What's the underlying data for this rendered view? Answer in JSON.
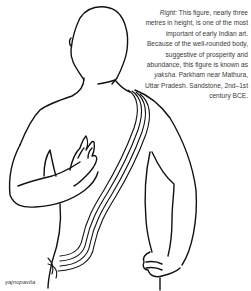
{
  "caption": {
    "lead": "Right:",
    "text_1": " This figure, nearly three metres in height, is one of the most important of early Indian art. Because of the well-rounded body, suggestive of prosperity and abundance, this figure is known as ",
    "term": "yaksha",
    "text_2": ". Parkham near Mathura, Uttar Pradesh. Sandstone, 2nd–1st century BCE."
  },
  "figure": {
    "label": "yajnopavita",
    "line_color": "#111111"
  }
}
